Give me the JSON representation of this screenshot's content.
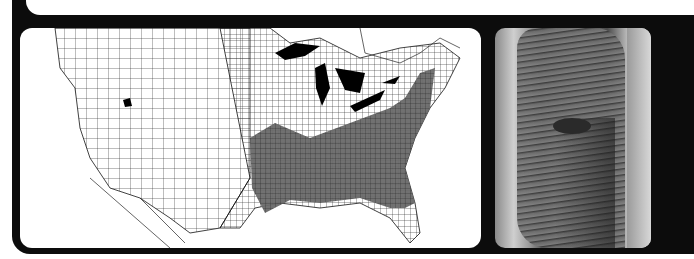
{
  "figure": {
    "map_panel": {
      "subject": "US county map",
      "shaded_region": "eastern and southeastern United States",
      "fill_shaded": "#5a5a5a",
      "fill_unshaded": "#ffffff",
      "water_fill": "#000000"
    },
    "photo_panel": {
      "subject": "tree trunk bark close-up",
      "tone": "grayscale"
    },
    "frame_color": "#0c0c0c"
  }
}
